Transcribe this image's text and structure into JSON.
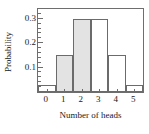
{
  "chart_data": {
    "type": "bar",
    "title": "",
    "xlabel": "Number of heads",
    "ylabel": "Probability",
    "categories": [
      "0",
      "1",
      "2",
      "3",
      "4",
      "5"
    ],
    "values": [
      0.03,
      0.15,
      0.3,
      0.3,
      0.15,
      0.03
    ],
    "ylim": [
      0,
      0.34
    ],
    "ytick_labels": [
      "0.1",
      "0.2",
      "0.3"
    ],
    "ytick_values": [
      0.1,
      0.2,
      0.3
    ],
    "yminor_step": 0.02,
    "grid": false,
    "legend": "none",
    "bar_fills": [
      "#ffffff",
      "#e3e3e3",
      "#e3e3e3",
      "#ffffff",
      "#ffffff",
      "#ffffff"
    ],
    "bar_edge_color": "#6b6b6b",
    "frame_color": "#6e6e6e",
    "text_color": "#1a1a1a"
  }
}
